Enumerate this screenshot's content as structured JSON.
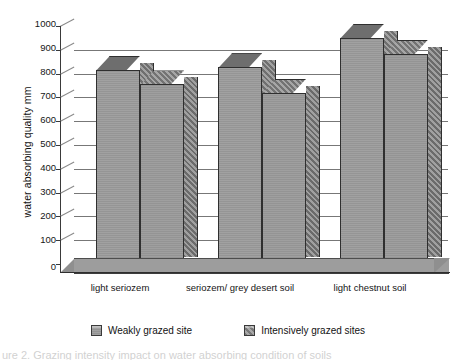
{
  "chart_data": {
    "type": "bar",
    "title": "",
    "xlabel": "",
    "ylabel": "water absorbing quality mm",
    "ylim": [
      0,
      1000
    ],
    "ytick_step": 100,
    "yticks": [
      1000,
      900,
      800,
      700,
      600,
      500,
      400,
      300,
      200,
      100,
      0
    ],
    "grid": true,
    "legend_position": "bottom",
    "style": "3d-grouped-bars-grayscale",
    "categories": [
      "light seriozem",
      "seriozem/ grey desert soil",
      "light chestnut soil"
    ],
    "series": [
      {
        "name": "Weakly grazed site",
        "values": [
          790,
          800,
          920
        ]
      },
      {
        "name": "Intensively grazed sites",
        "values": [
          730,
          695,
          855
        ]
      }
    ]
  },
  "axis": {
    "y_title": "water absorbing quality mm",
    "tick_labels": [
      "1000",
      "900",
      "800",
      "700",
      "600",
      "500",
      "400",
      "300",
      "200",
      "100",
      "0"
    ]
  },
  "legend": {
    "items": [
      {
        "label": "Weakly grazed site",
        "swatch": "series-a-swatch"
      },
      {
        "label": "Intensively grazed sites",
        "swatch": "series-b-swatch"
      }
    ]
  },
  "caption": {
    "text": "ure 2. Grazing intensity impact on water absorbing condition of soils"
  }
}
